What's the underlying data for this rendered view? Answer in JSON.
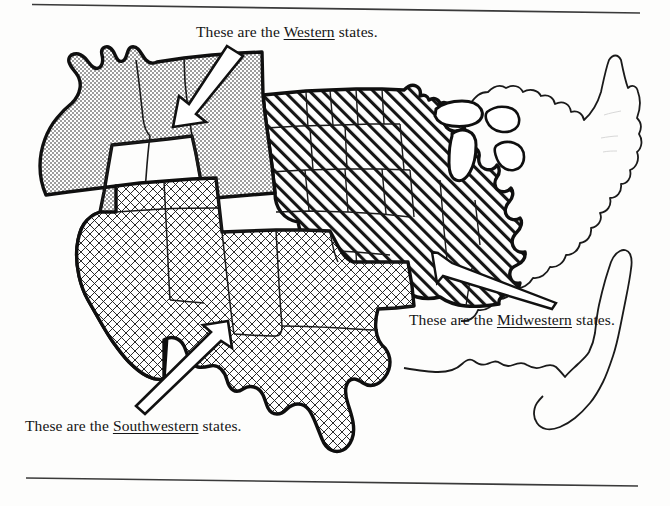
{
  "figure": {
    "kind": "us-regions-map",
    "background_color": "#fdfdfc",
    "ink_color": "#151515"
  },
  "rules": {
    "top": {
      "name": "top-rule",
      "color": "#3a3a3a"
    },
    "bottom": {
      "name": "bottom-rule",
      "color": "#3a3a3a"
    }
  },
  "captions": {
    "western": {
      "prefix": "These are the ",
      "emphasis": "Western",
      "suffix": " states.",
      "full": "These are the Western states."
    },
    "midwestern": {
      "prefix": "These are the ",
      "emphasis": "Midwestern",
      "suffix": " states.",
      "full": "These are the Midwestern states."
    },
    "southwestern": {
      "prefix": "These are the ",
      "emphasis": "Southwestern",
      "suffix": " states.",
      "full": "These are the Southwestern states."
    },
    "figure_note": {
      "full": ""
    }
  },
  "regions": [
    {
      "id": "western",
      "label": "Western",
      "pattern": "stipple-dots",
      "pattern_color": "#202020",
      "fill_description": "fine dotted stipple"
    },
    {
      "id": "southwestern",
      "label": "Southwestern",
      "pattern": "cross-hatch",
      "pattern_color": "#202020",
      "fill_description": "crossed grid hatching"
    },
    {
      "id": "midwestern",
      "label": "Midwestern",
      "pattern": "diagonal-hatch",
      "pattern_color": "#151515",
      "fill_description": "diagonal line hatching rising to the right"
    },
    {
      "id": "eastern",
      "label": "Eastern",
      "pattern": "none",
      "pattern_color": "#ffffff",
      "fill_description": "unshaded white"
    }
  ],
  "arrows": [
    {
      "id": "arrow-western",
      "points_to": "western",
      "direction": "down-left",
      "style": "white-filled-outline"
    },
    {
      "id": "arrow-midwestern",
      "points_to": "midwestern",
      "direction": "up-left",
      "style": "white-filled-outline"
    },
    {
      "id": "arrow-southwestern",
      "points_to": "southwestern",
      "direction": "up-right",
      "style": "white-filled-outline"
    }
  ]
}
